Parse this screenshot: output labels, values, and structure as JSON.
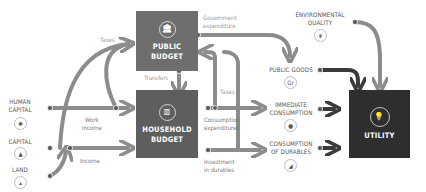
{
  "diagram": {
    "colors": {
      "public_budget_box": "#6e6e6e",
      "household_budget_box": "#5e5e5e",
      "utility_box": "#2e2e2e",
      "flow_light": "#8c8c8c",
      "flow_dark": "#3a3a3a",
      "label_text": "#555555",
      "flow_label_text": "#9a9a9a"
    },
    "nodes": {
      "public_budget": {
        "line1": "PUBLIC",
        "line2": "BUDGET",
        "icon": "bank-building-icon",
        "glyph": "🏛"
      },
      "household_budget": {
        "line1": "HOUSEHOLD",
        "line2": "BUDGET",
        "icon": "household-icon",
        "glyph": "▥"
      },
      "utility": {
        "label": "UTILITY",
        "icon": "lightbulb-icon",
        "glyph": "💡"
      }
    },
    "inputs": [
      {
        "id": "human_capital",
        "line1": "HUMAN",
        "line2": "CAPITAL",
        "icon": "person-icon",
        "glyph": "✱"
      },
      {
        "id": "capital",
        "line1": "CAPITAL",
        "icon": "pile-icon",
        "glyph": "▲"
      },
      {
        "id": "land",
        "line1": "LAND",
        "icon": "land-icon",
        "glyph": "▴"
      }
    ],
    "outputs": [
      {
        "id": "environmental_quality",
        "line1": "ENVIRONMENTAL",
        "line2": "QUALITY",
        "icon": "leaf-icon",
        "glyph": "❦"
      },
      {
        "id": "public_goods",
        "line1": "PUBLIC GOODS",
        "icon": "public-goods-icon",
        "glyph": "Gr"
      },
      {
        "id": "immediate_consumption",
        "line1": "IMMEDIATE",
        "line2": "CONSUMPTION",
        "icon": "bottle-icon",
        "glyph": "●"
      },
      {
        "id": "consumption_durables",
        "line1": "CONSUMPTION",
        "line2": "OF DURABLES",
        "icon": "durables-icon",
        "glyph": "◢"
      }
    ],
    "flow_labels": {
      "taxes_top": "Taxes",
      "government_expenditure_1": "Government",
      "government_expenditure_2": "expenditure",
      "transfers": "Transfers",
      "taxes_mid": "Taxes",
      "work_income_1": "Work",
      "work_income_2": "Income",
      "income": "Income",
      "consumption_expenditures_1": "Consumption",
      "consumption_expenditures_2": "expenditures",
      "investment_durables_1": "Investment",
      "investment_durables_2": "in durables"
    }
  }
}
